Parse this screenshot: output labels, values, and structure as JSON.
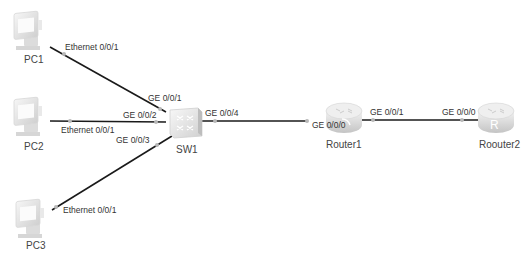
{
  "diagram": {
    "type": "network-topology",
    "devices": [
      {
        "id": "pc1",
        "name": "PC1",
        "kind": "pc"
      },
      {
        "id": "pc2",
        "name": "PC2",
        "kind": "pc"
      },
      {
        "id": "pc3",
        "name": "PC3",
        "kind": "pc"
      },
      {
        "id": "sw1",
        "name": "SW1",
        "kind": "switch"
      },
      {
        "id": "router1",
        "name": "Router1",
        "kind": "router"
      },
      {
        "id": "router2",
        "name": "Roouter2",
        "kind": "router"
      }
    ],
    "links": [
      {
        "from": "PC1",
        "from_port": "Ethernet 0/0/1",
        "to": "SW1",
        "to_port": "GE 0/0/1"
      },
      {
        "from": "PC2",
        "from_port": "Ethernet 0/0/1",
        "to": "SW1",
        "to_port": "GE 0/0/2"
      },
      {
        "from": "PC3",
        "from_port": "Ethernet 0/0/1",
        "to": "SW1",
        "to_port": "GE 0/0/3"
      },
      {
        "from": "SW1",
        "from_port": "GE 0/0/4",
        "to": "Router1",
        "to_port": "GE 0/0/0"
      },
      {
        "from": "Router1",
        "from_port": "GE 0/0/1",
        "to": "Roouter2",
        "to_port": "GE 0/0/0"
      }
    ],
    "labels": {
      "pc1_port": "Ethernet 0/0/1",
      "pc2_port": "Ethernet 0/0/1",
      "pc3_port": "Ethernet 0/0/1",
      "sw1_ge1": "GE 0/0/1",
      "sw1_ge2": "GE 0/0/2",
      "sw1_ge3": "GE 0/0/3",
      "sw1_ge4": "GE 0/0/4",
      "r1_ge0": "GE 0/0/0",
      "r1_ge1": "GE 0/0/1",
      "r2_ge0": "GE 0/0/0"
    },
    "colors": {
      "link": "#1a1a1a",
      "port_dot": "#b8b8b8",
      "device_fill": "#e6e6e6",
      "label_text": "#333333"
    }
  }
}
